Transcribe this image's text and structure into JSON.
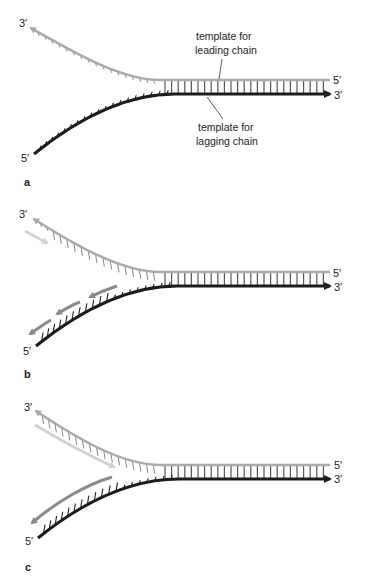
{
  "figure": {
    "colors": {
      "template_leading": "#a9a9a9",
      "template_lagging": "#1c1c1c",
      "new_leading": "#d2d2d2",
      "new_lagging": "#8a8a8a",
      "text": "#222222"
    },
    "panels": [
      {
        "id": "a",
        "label": "a",
        "label_pos": [
          25,
          186
        ],
        "top_strand": {
          "end_label": "3′",
          "start_label": "5′"
        },
        "bottom_strand": {
          "end_label": "3′",
          "start_label": "5′"
        },
        "offset_y": 0,
        "callouts": [
          {
            "line1": "template for",
            "line2": "leading chain"
          },
          {
            "line1": "template for",
            "line2": "lagging chain"
          }
        ]
      },
      {
        "id": "b",
        "label": "b",
        "label_pos": [
          25,
          375
        ],
        "top_strand": {
          "end_label": "3′",
          "start_label": "5′"
        },
        "bottom_strand": {
          "end_label": "3′",
          "start_label": "5′"
        },
        "offset_y": 192
      },
      {
        "id": "c",
        "label": "c",
        "label_pos": [
          27,
          570
        ],
        "top_strand": {
          "end_label": "3′",
          "start_label": "5′"
        },
        "bottom_strand": {
          "end_label": "3′",
          "start_label": "5′"
        },
        "offset_y": 385
      }
    ]
  }
}
